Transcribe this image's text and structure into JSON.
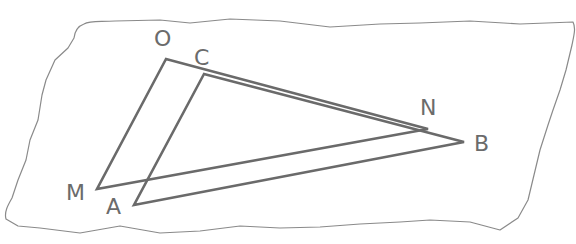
{
  "diagram": {
    "colors": {
      "line": "#6a6a6a",
      "paper_edge": "#8a8a8a",
      "label": "#6b6b6b",
      "background": "#ffffff"
    },
    "triangles": [
      {
        "name": "OMN",
        "vertices": [
          "O",
          "M",
          "N"
        ]
      },
      {
        "name": "CAB",
        "vertices": [
          "C",
          "A",
          "B"
        ]
      }
    ],
    "points": {
      "O": {
        "label": "O",
        "x": 166,
        "y": 59
      },
      "C": {
        "label": "C",
        "x": 204,
        "y": 74
      },
      "N": {
        "label": "N",
        "x": 428,
        "y": 129
      },
      "B": {
        "label": "B",
        "x": 464,
        "y": 142
      },
      "M": {
        "label": "M",
        "x": 97,
        "y": 189
      },
      "A": {
        "label": "A",
        "x": 134,
        "y": 205
      }
    },
    "labels": {
      "O": "O",
      "C": "C",
      "N": "N",
      "B": "B",
      "M": "M",
      "A": "A"
    }
  }
}
